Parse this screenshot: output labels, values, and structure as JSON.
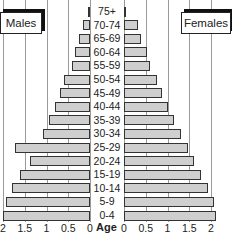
{
  "chart_data": {
    "type": "bar",
    "subtype": "population-pyramid",
    "title": "",
    "xlabel": "",
    "ylabel": "Age",
    "categories": [
      "75+",
      "70-74",
      "65-69",
      "60-64",
      "55-59",
      "50-54",
      "45-49",
      "40-44",
      "35-39",
      "30-34",
      "25-29",
      "20-24",
      "15-19",
      "10-14",
      "5-9",
      "0-4"
    ],
    "series": [
      {
        "name": "Males",
        "values": [
          0.05,
          0.15,
          0.25,
          0.35,
          0.42,
          0.6,
          0.68,
          0.8,
          0.95,
          1.08,
          1.72,
          1.38,
          1.62,
          1.8,
          1.92,
          2.0
        ]
      },
      {
        "name": "Females",
        "values": [
          0.03,
          0.32,
          0.4,
          0.52,
          0.6,
          0.75,
          0.88,
          1.0,
          1.15,
          1.3,
          1.48,
          1.62,
          1.78,
          1.92,
          2.07,
          2.12
        ]
      }
    ],
    "xlim": [
      0,
      2.2
    ],
    "x_ticks_left": [
      "2",
      "1.5",
      "1",
      "0.5",
      "0"
    ],
    "x_ticks_right": [
      "0",
      "0.5",
      "1",
      "1.5",
      "2"
    ],
    "grid": true,
    "legend": [
      "Males",
      "Females"
    ],
    "colors": {
      "bar_fill": "#cfcfcf",
      "bar_border": "#333333",
      "grid": "#9a9a9a"
    }
  },
  "labels": {
    "males": "Males",
    "females": "Females",
    "age_axis": "Age"
  }
}
